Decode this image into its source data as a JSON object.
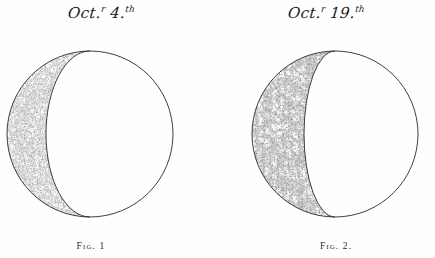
{
  "plate": {
    "background_color": "#fefefe",
    "ink_color": "#1c1c1c",
    "figures": [
      {
        "date_caption": {
          "month": "Oct",
          "month_suffix": "r",
          "day": "4",
          "day_suffix": "th",
          "full_text": "Oct.r 4.th"
        },
        "fig_label": "Fig. 1",
        "phase": "waning crescent",
        "illumination_side": "left",
        "crescent_width_px": 42,
        "disc": {
          "cx": 85,
          "cy": 96,
          "r": 83
        },
        "shading_style": "stipple",
        "shading_density": "light"
      },
      {
        "date_caption": {
          "month": "Oct",
          "month_suffix": "r",
          "day": "19",
          "day_suffix": "th",
          "full_text": "Oct.r 19.th"
        },
        "fig_label": "Fig. 2.",
        "phase": "waning crescent",
        "illumination_side": "left",
        "crescent_width_px": 52,
        "disc": {
          "cx": 85,
          "cy": 96,
          "r": 83
        },
        "shading_style": "stipple",
        "shading_density": "heavy"
      }
    ]
  }
}
